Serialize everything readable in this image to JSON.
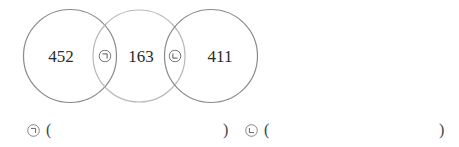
{
  "diagram": {
    "type": "venn-three-circles",
    "circles": [
      {
        "id": "left",
        "cx": 70,
        "cy": 56,
        "r": 47,
        "stroke": "#8a8a8a",
        "value": "452"
      },
      {
        "id": "middle",
        "cx": 139,
        "cy": 56,
        "r": 46,
        "stroke": "#b5b5b5",
        "value": "163"
      },
      {
        "id": "right",
        "cx": 211,
        "cy": 56,
        "r": 47,
        "stroke": "#8a8a8a",
        "value": "411"
      }
    ],
    "numbers": {
      "left": "452",
      "middle": "163",
      "right": "411"
    },
    "markers": {
      "first": "ㄱ",
      "second": "ㄴ"
    }
  },
  "answers": [
    {
      "label": "ㄱ",
      "open": "(",
      "close": ")",
      "value": ""
    },
    {
      "label": "ㄴ",
      "open": "(",
      "close": ")",
      "value": ""
    }
  ]
}
